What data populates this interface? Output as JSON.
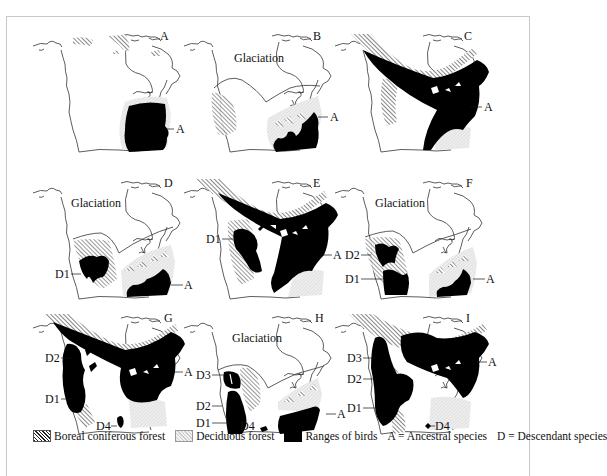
{
  "figure": {
    "panels": [
      {
        "id": "A",
        "letter": "A",
        "glaciation": "",
        "labels": [
          {
            "text": "A",
            "role": "ancestral"
          }
        ]
      },
      {
        "id": "B",
        "letter": "B",
        "glaciation": "Glaciation",
        "labels": [
          {
            "text": "A",
            "role": "ancestral"
          }
        ]
      },
      {
        "id": "C",
        "letter": "C",
        "glaciation": "",
        "labels": [
          {
            "text": "A",
            "role": "ancestral"
          }
        ]
      },
      {
        "id": "D",
        "letter": "D",
        "glaciation": "Glaciation",
        "labels": [
          {
            "text": "D1",
            "role": "descendant"
          },
          {
            "text": "A",
            "role": "ancestral"
          }
        ]
      },
      {
        "id": "E",
        "letter": "E",
        "glaciation": "",
        "labels": [
          {
            "text": "D1",
            "role": "descendant"
          },
          {
            "text": "A",
            "role": "ancestral"
          }
        ]
      },
      {
        "id": "F",
        "letter": "F",
        "glaciation": "Glaciation",
        "labels": [
          {
            "text": "D2",
            "role": "descendant"
          },
          {
            "text": "D1",
            "role": "descendant"
          },
          {
            "text": "A",
            "role": "ancestral"
          }
        ]
      },
      {
        "id": "G",
        "letter": "G",
        "glaciation": "",
        "labels": [
          {
            "text": "D2",
            "role": "descendant"
          },
          {
            "text": "D1",
            "role": "descendant"
          },
          {
            "text": "D4",
            "role": "descendant"
          },
          {
            "text": "A",
            "role": "ancestral"
          }
        ]
      },
      {
        "id": "H",
        "letter": "H",
        "glaciation": "Glaciation",
        "labels": [
          {
            "text": "D3",
            "role": "descendant"
          },
          {
            "text": "D2",
            "role": "descendant"
          },
          {
            "text": "D1",
            "role": "descendant"
          },
          {
            "text": "D4",
            "role": "descendant"
          },
          {
            "text": "A",
            "role": "ancestral"
          }
        ]
      },
      {
        "id": "I",
        "letter": "I",
        "glaciation": "",
        "labels": [
          {
            "text": "D3",
            "role": "descendant"
          },
          {
            "text": "D2",
            "role": "descendant"
          },
          {
            "text": "D1",
            "role": "descendant"
          },
          {
            "text": "D4",
            "role": "descendant"
          },
          {
            "text": "A",
            "role": "ancestral"
          }
        ]
      }
    ]
  },
  "legend": {
    "boreal": "Boreal coniferous forest",
    "deciduous": "Deciduous forest",
    "ranges": "Ranges of birds",
    "ancestral": "A = Ancestral species",
    "descendant": "D = Descendant species"
  },
  "colors": {
    "range": "#000000",
    "deciduous": "#e6e6e6",
    "boreal_hatch": "#222222",
    "coast": "#333333",
    "frame": "#c8c8c8"
  }
}
